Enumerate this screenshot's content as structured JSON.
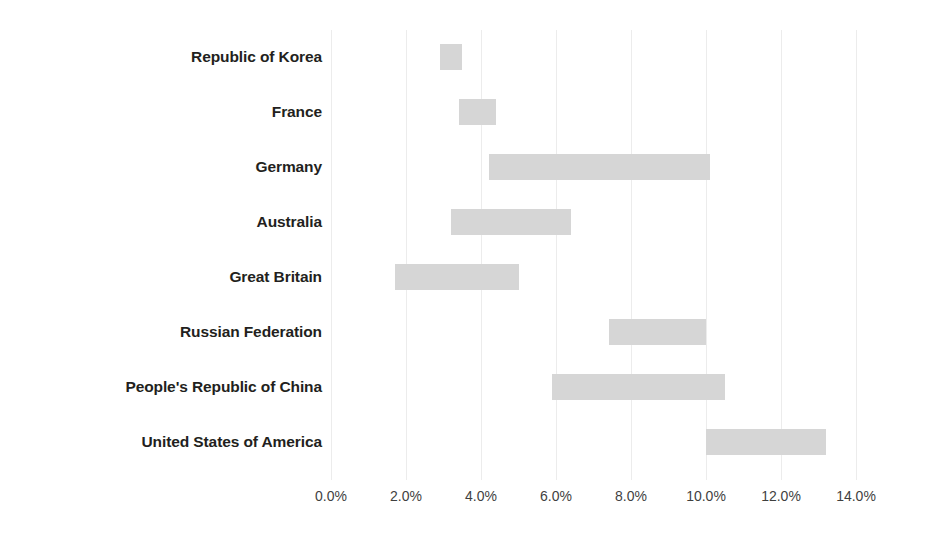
{
  "chart_data": {
    "type": "bar",
    "subtype": "floating-range-bar",
    "title": "",
    "xlabel": "",
    "ylabel": "",
    "xlim": [
      0,
      14
    ],
    "xtick_labels": [
      "0.0%",
      "2.0%",
      "4.0%",
      "6.0%",
      "8.0%",
      "10.0%",
      "12.0%",
      "14.0%"
    ],
    "xticks": [
      0,
      2,
      4,
      6,
      8,
      10,
      12,
      14
    ],
    "grid": true,
    "grid_axis": "x",
    "legend": false,
    "bar_color": "#d6d6d6",
    "background_color": "#ffffff",
    "value_unit": "%",
    "categories": [
      "Republic of Korea",
      "France",
      "Germany",
      "Australia",
      "Great Britain",
      "Russian Federation",
      "People's Republic of China",
      "United States of America"
    ],
    "series": [
      {
        "name": "Range start",
        "values": [
          2.9,
          3.4,
          4.2,
          3.2,
          1.7,
          7.4,
          5.9,
          10.0
        ]
      },
      {
        "name": "Range end",
        "values": [
          3.5,
          4.4,
          10.1,
          6.4,
          5.0,
          10.0,
          10.5,
          13.2
        ]
      }
    ],
    "bars": [
      {
        "category": "Republic of Korea",
        "start": 2.9,
        "end": 3.5
      },
      {
        "category": "France",
        "start": 3.4,
        "end": 4.4
      },
      {
        "category": "Germany",
        "start": 4.2,
        "end": 10.1
      },
      {
        "category": "Australia",
        "start": 3.2,
        "end": 6.4
      },
      {
        "category": "Great Britain",
        "start": 1.7,
        "end": 5.0
      },
      {
        "category": "Russian Federation",
        "start": 7.4,
        "end": 10.0
      },
      {
        "category": "People's Republic of China",
        "start": 5.9,
        "end": 10.5
      },
      {
        "category": "United States of America",
        "start": 10.0,
        "end": 13.2
      }
    ]
  }
}
